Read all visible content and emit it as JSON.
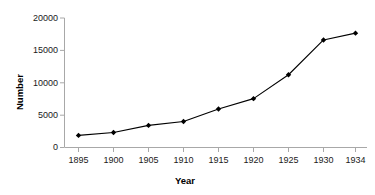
{
  "chart_data": {
    "type": "line",
    "title": "",
    "subtitle": "",
    "xlabel": "Year",
    "ylabel": "Number",
    "x": [
      1895,
      1900,
      1905,
      1910,
      1915,
      1920,
      1925,
      1930,
      1934
    ],
    "categories": [
      "1895",
      "1900",
      "1905",
      "1910",
      "1915",
      "1920",
      "1925",
      "1930",
      "1934"
    ],
    "values": [
      1800,
      2250,
      3350,
      3950,
      5900,
      7500,
      11200,
      16600,
      17650
    ],
    "series": [
      {
        "name": "Number",
        "values": [
          1800,
          2250,
          3350,
          3950,
          5900,
          7500,
          11200,
          16600,
          17650
        ],
        "color": "#000000",
        "marker": "diamond",
        "line_width": 1
      }
    ],
    "xlim": [
      1893,
      1936
    ],
    "ylim": [
      0,
      20000
    ],
    "yticks": [
      0,
      5000,
      10000,
      15000,
      20000
    ],
    "ytick_labels": [
      "0",
      "5000",
      "10000",
      "15000",
      "20000"
    ],
    "xticks": [
      1895,
      1900,
      1905,
      1910,
      1915,
      1920,
      1925,
      1930,
      1934
    ],
    "xtick_labels": [
      "1895",
      "1900",
      "1905",
      "1910",
      "1915",
      "1920",
      "1925",
      "1930",
      "1934"
    ],
    "grid": false,
    "legend": false,
    "legend_position": "none",
    "axis_color": "#a6a6a6",
    "plot_background": "#ffffff"
  },
  "axes": {
    "y_title": "Number",
    "x_title": "Year"
  },
  "y_labels": {
    "t0": "0",
    "t1": "5000",
    "t2": "10000",
    "t3": "15000",
    "t4": "20000"
  },
  "x_labels": {
    "t0": "1895",
    "t1": "1900",
    "t2": "1905",
    "t3": "1910",
    "t4": "1915",
    "t5": "1920",
    "t6": "1925",
    "t7": "1930",
    "t8": "1934"
  }
}
